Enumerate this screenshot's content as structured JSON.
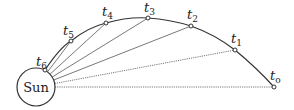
{
  "diagram": {
    "title": "",
    "central_body": {
      "label": "Sun"
    },
    "orbit_points": [
      {
        "id": "t0",
        "symbol": "t",
        "subscript": "o"
      },
      {
        "id": "t1",
        "symbol": "t",
        "subscript": "1"
      },
      {
        "id": "t2",
        "symbol": "t",
        "subscript": "2"
      },
      {
        "id": "t3",
        "symbol": "t",
        "subscript": "3"
      },
      {
        "id": "t4",
        "symbol": "t",
        "subscript": "4"
      },
      {
        "id": "t5",
        "symbol": "t",
        "subscript": "5"
      },
      {
        "id": "t6",
        "symbol": "t",
        "subscript": "6"
      }
    ],
    "radius_lines": "dotted lines from the Sun to each orbit point t0..t6",
    "colors": {
      "stroke": "#333333",
      "background": "#ffffff"
    }
  }
}
